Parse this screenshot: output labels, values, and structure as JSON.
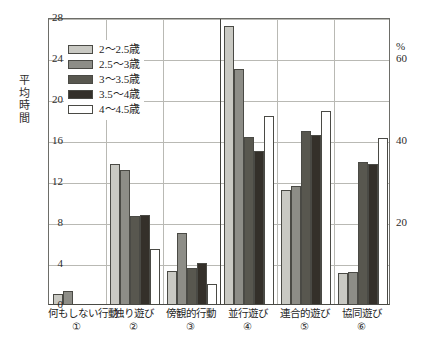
{
  "chart_data": {
    "type": "bar",
    "title": "",
    "xlabel": "",
    "ylabel": "平均時間",
    "ylabel_right": "%",
    "ylim": [
      0,
      28
    ],
    "yticks": [
      0,
      4,
      8,
      12,
      16,
      20,
      24,
      28
    ],
    "ylim_right": [
      0,
      70
    ],
    "yticks_right": [
      20,
      40,
      60
    ],
    "grid": true,
    "legend_position": "upper-left-inside",
    "categories": [
      "何もしない行動",
      "独り遊び",
      "傍観的行動",
      "並行遊び",
      "連合的遊び",
      "協同遊び"
    ],
    "category_numbers": [
      "①",
      "②",
      "③",
      "④",
      "⑤",
      "⑥"
    ],
    "series": [
      {
        "name": "2～2.5歳",
        "color": "#c9c9c3",
        "values": [
          1.0,
          13.7,
          3.2,
          27.1,
          11.1,
          3.0
        ]
      },
      {
        "name": "2.5～3歳",
        "color": "#8d8d87",
        "values": [
          1.3,
          13.1,
          6.9,
          22.9,
          11.5,
          3.1
        ]
      },
      {
        "name": "3～3.5歳",
        "color": "#58574f",
        "values": [
          0.0,
          8.6,
          3.5,
          16.3,
          16.9,
          13.9
        ]
      },
      {
        "name": "3.5～4歳",
        "color": "#34302a",
        "values": [
          0.0,
          8.7,
          4.0,
          14.9,
          16.5,
          13.7
        ]
      },
      {
        "name": "4～4.5歳",
        "color": "#ffffff",
        "values": [
          0.0,
          5.4,
          2.0,
          18.3,
          18.8,
          16.2
        ]
      }
    ]
  }
}
